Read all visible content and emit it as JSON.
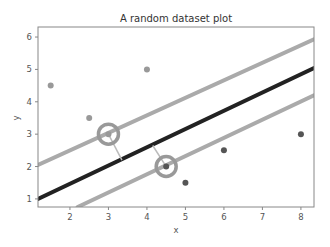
{
  "chart_data": {
    "type": "scatter",
    "title": "A random dataset plot",
    "xlabel": "x",
    "ylabel": "y",
    "xlim": [
      1.17,
      8.34
    ],
    "ylim": [
      0.75,
      6.31
    ],
    "xticks": [
      2,
      3,
      4,
      5,
      6,
      7,
      8
    ],
    "yticks": [
      1,
      2,
      3,
      4,
      5,
      6
    ],
    "grid": false,
    "legend": null,
    "series": [
      {
        "name": "class A",
        "color": "#999999",
        "points": [
          [
            1.5,
            4.5
          ],
          [
            2.5,
            3.5
          ],
          [
            4,
            5
          ],
          [
            3,
            3
          ]
        ]
      },
      {
        "name": "class B",
        "color": "#555555",
        "points": [
          [
            5,
            1.5
          ],
          [
            6,
            2.5
          ],
          [
            8,
            3
          ],
          [
            4.5,
            2
          ]
        ]
      }
    ],
    "lines": [
      {
        "name": "decision boundary",
        "color": "#222222",
        "width": 4,
        "from": [
          1.17,
          1.0
        ],
        "to": [
          8.34,
          5.04
        ]
      },
      {
        "name": "upper margin",
        "color": "#aaaaaa",
        "width": 4,
        "from": [
          1.17,
          2.05
        ],
        "to": [
          8.34,
          5.93
        ]
      },
      {
        "name": "lower margin",
        "color": "#aaaaaa",
        "width": 4,
        "from": [
          2.2,
          0.75
        ],
        "to": [
          8.34,
          4.2
        ]
      }
    ],
    "support_vectors": [
      {
        "point": [
          3,
          3
        ],
        "color": "#999999"
      },
      {
        "point": [
          4.5,
          2
        ],
        "color": "#999999"
      }
    ],
    "connectors": [
      {
        "from": [
          3,
          3
        ],
        "to": [
          3.35,
          2.2
        ]
      },
      {
        "from": [
          4.5,
          2
        ],
        "to": [
          4.15,
          2.65
        ]
      }
    ]
  }
}
